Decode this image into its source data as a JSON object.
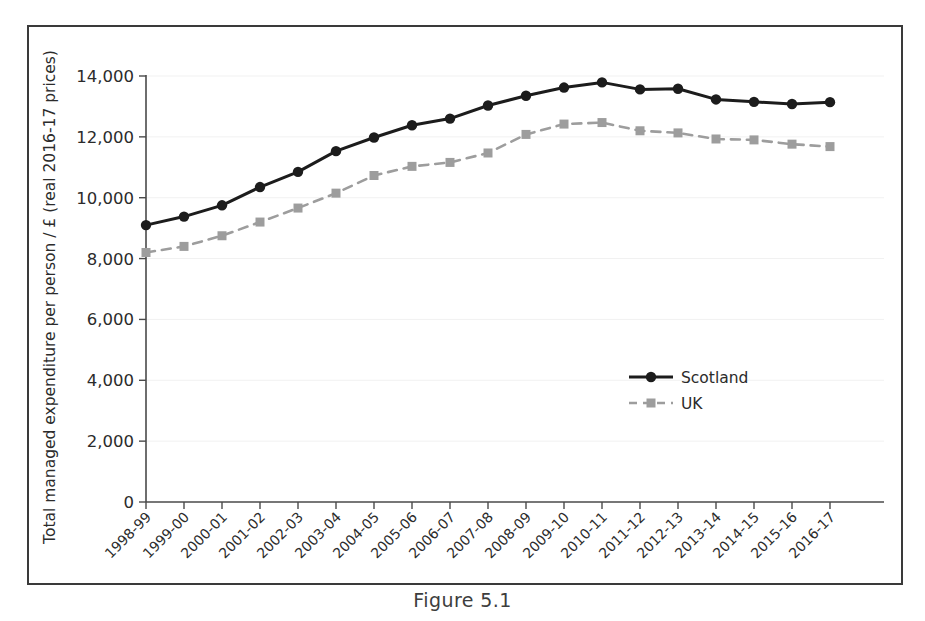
{
  "figure": {
    "caption": "Figure 5.1"
  },
  "chart_data": {
    "type": "line",
    "title": "",
    "xlabel": "",
    "ylabel": "Total managed expenditure per person / £ (real 2016-17 prices)",
    "ylim": [
      0,
      14000
    ],
    "yticks": [
      0,
      2000,
      4000,
      6000,
      8000,
      10000,
      12000,
      14000
    ],
    "ytick_labels": [
      "0",
      "2,000",
      "4,000",
      "6,000",
      "8,000",
      "10,000",
      "12,000",
      "14,000"
    ],
    "grid": true,
    "legend_position": "center-right",
    "categories": [
      "1998-99",
      "1999-00",
      "2000-01",
      "2001-02",
      "2002-03",
      "2003-04",
      "2004-05",
      "2005-06",
      "2006-07",
      "2007-08",
      "2008-09",
      "2009-10",
      "2010-11",
      "2011-12",
      "2012-13",
      "2013-14",
      "2014-15",
      "2015-16",
      "2016-17"
    ],
    "series": [
      {
        "name": "Scotland",
        "color": "#1c1c1c",
        "marker": "circle",
        "linestyle": "solid",
        "values": [
          9100,
          9380,
          9750,
          10350,
          10850,
          11530,
          11980,
          12380,
          12600,
          13030,
          13350,
          13620,
          13790,
          13560,
          13580,
          13230,
          13150,
          13080,
          13140
        ]
      },
      {
        "name": "UK",
        "color": "#9d9d9d",
        "marker": "square",
        "linestyle": "dashed",
        "values": [
          8200,
          8400,
          8750,
          9200,
          9660,
          10150,
          10730,
          11030,
          11160,
          11470,
          12080,
          12420,
          12470,
          12200,
          12130,
          11930,
          11900,
          11760,
          11680
        ]
      }
    ]
  }
}
